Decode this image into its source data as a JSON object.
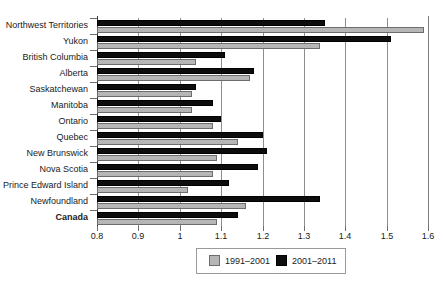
{
  "chart_data": {
    "type": "bar",
    "orientation": "horizontal",
    "title": "",
    "subtitle": "",
    "xlabel": "",
    "ylabel": "",
    "xlim": [
      0.8,
      1.6
    ],
    "xticks": [
      0.8,
      0.9,
      1.0,
      1.1,
      1.2,
      1.3,
      1.4,
      1.5,
      1.6
    ],
    "xtick_labels": [
      "0.8",
      "0.9",
      "1",
      "1.1",
      "1.2",
      "1.3",
      "1.4",
      "1.5",
      "1.6"
    ],
    "grid": true,
    "grid_axis": "x",
    "legend_position": "bottom-center",
    "categories": [
      "Northwest Territories",
      "Yukon",
      "British Columbia",
      "Alberta",
      "Saskatchewan",
      "Manitoba",
      "Ontario",
      "Quebec",
      "New Brunswick",
      "Nova Scotia",
      "Prince Edward Island",
      "Newfoundland",
      "Canada"
    ],
    "emphasized_categories": [
      "Canada"
    ],
    "series": [
      {
        "name": "1991–2001",
        "color": "#b6b6b6",
        "edge_color": "#6d6d6d",
        "values": [
          1.59,
          1.34,
          1.04,
          1.17,
          1.03,
          1.03,
          1.08,
          1.14,
          1.09,
          1.08,
          1.02,
          1.16,
          1.09
        ]
      },
      {
        "name": "2001–2011",
        "color": "#0d0d0d",
        "edge_color": "#000000",
        "values": [
          1.35,
          1.51,
          1.11,
          1.18,
          1.04,
          1.08,
          1.1,
          1.2,
          1.21,
          1.19,
          1.12,
          1.34,
          1.14
        ]
      }
    ]
  },
  "legend": {
    "items": [
      {
        "label": "1991–2001",
        "swatch": "gray"
      },
      {
        "label": "2001–2011",
        "swatch": "black"
      }
    ]
  }
}
